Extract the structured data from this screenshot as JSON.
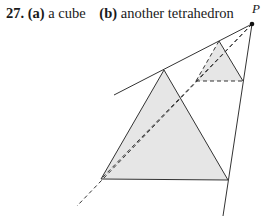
{
  "answer": {
    "number": "27.",
    "part_a_label": "(a)",
    "part_a_text": "a cube",
    "part_b_label": "(b)",
    "part_b_text": "another tetrahedron"
  },
  "figure": {
    "point_label": "P",
    "fill_color": "#e8e8e8",
    "line_color": "#333333",
    "point_P": [
      252,
      24
    ],
    "large_triangle": [
      [
        164,
        70
      ],
      [
        101,
        179
      ],
      [
        228,
        180
      ]
    ],
    "small_triangle": [
      [
        219,
        41
      ],
      [
        196,
        81
      ],
      [
        243,
        81
      ]
    ]
  }
}
